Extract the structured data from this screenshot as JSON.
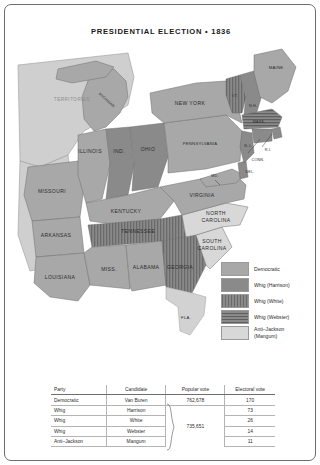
{
  "title": "PRESIDENTIAL ELECTION • 1836",
  "map": {
    "labels": [
      {
        "id": "territories",
        "text": "TERRITORIES"
      },
      {
        "id": "michigan",
        "text": "MICHIGAN"
      },
      {
        "id": "maine",
        "text": "MAINE"
      },
      {
        "id": "vermont",
        "text": "VT."
      },
      {
        "id": "new-hampshire",
        "text": "N.H."
      },
      {
        "id": "massachusetts",
        "text": "MASS."
      },
      {
        "id": "rhode-island",
        "text": "R.I."
      },
      {
        "id": "connecticut",
        "text": "CONN."
      },
      {
        "id": "new-york",
        "text": "NEW YORK"
      },
      {
        "id": "pennsylvania",
        "text": "PENNSYLVANIA"
      },
      {
        "id": "new-jersey",
        "text": "N.J."
      },
      {
        "id": "delaware",
        "text": "DEL."
      },
      {
        "id": "maryland",
        "text": "MD."
      },
      {
        "id": "virginia",
        "text": "VIRGINIA"
      },
      {
        "id": "ohio",
        "text": "OHIO"
      },
      {
        "id": "indiana",
        "text": "IND."
      },
      {
        "id": "illinois",
        "text": "ILLINOIS"
      },
      {
        "id": "missouri",
        "text": "MISSOURI"
      },
      {
        "id": "kentucky",
        "text": "KENTUCKY"
      },
      {
        "id": "tennessee",
        "text": "TENNESSEE"
      },
      {
        "id": "arkansas",
        "text": "ARKANSAS"
      },
      {
        "id": "louisiana",
        "text": "LOUISIANA"
      },
      {
        "id": "mississippi",
        "text": "MISS."
      },
      {
        "id": "alabama",
        "text": "ALABAMA"
      },
      {
        "id": "georgia",
        "text": "GEORGIA"
      },
      {
        "id": "north-carolina",
        "text": "NORTH"
      },
      {
        "id": "north-carolina-2",
        "text": "CAROLINA"
      },
      {
        "id": "south-carolina",
        "text": "SOUTH"
      },
      {
        "id": "south-carolina-2",
        "text": "CAROLINA"
      },
      {
        "id": "florida",
        "text": "FLA."
      }
    ]
  },
  "legend": {
    "items": [
      {
        "label": "Democratic",
        "fill": "#a8a8a8",
        "pattern": "solid"
      },
      {
        "label": "Whig (Harrison)",
        "fill": "#8a8a8a",
        "pattern": "solid"
      },
      {
        "label": "Whig  (White)",
        "fill": "#8a8a8a",
        "pattern": "vertical"
      },
      {
        "label": "Whig (Webster)",
        "fill": "#8a8a8a",
        "pattern": "horizontal"
      },
      {
        "label": "Anti–Jackson",
        "label2": "(Mangum)",
        "fill": "#d8d8d8",
        "pattern": "solid"
      }
    ]
  },
  "table": {
    "headers": [
      "Party",
      "Candidate",
      "Popular vote",
      "Electoral vote"
    ],
    "rows": [
      {
        "party": "Democratic",
        "candidate": "Van Buren",
        "popular": "762,678",
        "electoral": "170"
      },
      {
        "party": "Whig",
        "candidate": "Harrison",
        "popular": "",
        "electoral": "73"
      },
      {
        "party": "Whig",
        "candidate": "White",
        "popular": "735,651",
        "electoral": "26"
      },
      {
        "party": "Whig",
        "candidate": "Webster",
        "popular": "",
        "electoral": "14"
      },
      {
        "party": "Anti–Jackson",
        "candidate": "Mangum",
        "popular": "",
        "electoral": "11"
      }
    ],
    "grouped_popular_vote": "735,651"
  },
  "colors": {
    "democratic": "#a8a8a8",
    "whig": "#8a8a8a",
    "anti_jackson": "#d8d8d8",
    "water": "#ffffff",
    "territory": "#cfcfcf",
    "border": "#6e6e6e"
  }
}
